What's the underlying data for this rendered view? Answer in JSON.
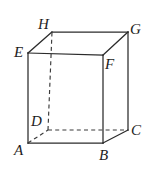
{
  "figure": {
    "kind": "cuboid-oblique-projection",
    "canvas": {
      "width": 150,
      "height": 169
    },
    "colors": {
      "background": "#ffffff",
      "edge_solid": "#2b2b2b",
      "edge_hidden": "#3a3a3a",
      "label": "#1d1d1d",
      "watermark": "#f2f2f2"
    },
    "watermark": {
      "text": "",
      "x": 38,
      "y": 3
    },
    "vertices": [
      {
        "id": "A",
        "x": 28,
        "y": 143,
        "label": "A",
        "label_x": 14,
        "label_y": 143
      },
      {
        "id": "B",
        "x": 103,
        "y": 143,
        "label": "B",
        "label_x": 99,
        "label_y": 148
      },
      {
        "id": "C",
        "x": 128,
        "y": 130,
        "label": "C",
        "label_x": 131,
        "label_y": 123
      },
      {
        "id": "D",
        "x": 48,
        "y": 130,
        "label": "D",
        "label_x": 31,
        "label_y": 114
      },
      {
        "id": "E",
        "x": 28,
        "y": 53,
        "label": "E",
        "label_x": 14,
        "label_y": 45
      },
      {
        "id": "F",
        "x": 103,
        "y": 55,
        "label": "F",
        "label_x": 105,
        "label_y": 57
      },
      {
        "id": "G",
        "x": 128,
        "y": 32,
        "label": "G",
        "label_x": 130,
        "label_y": 22
      },
      {
        "id": "H",
        "x": 52,
        "y": 32,
        "label": "H",
        "label_x": 38,
        "label_y": 17
      }
    ],
    "edges": [
      {
        "id": "EA",
        "from": "E",
        "to": "A",
        "style": "solid",
        "name": "edge-e-a"
      },
      {
        "id": "AB",
        "from": "A",
        "to": "B",
        "style": "solid",
        "name": "edge-a-b"
      },
      {
        "id": "BF",
        "from": "B",
        "to": "F",
        "style": "solid",
        "name": "edge-b-f"
      },
      {
        "id": "EF",
        "from": "E",
        "to": "F",
        "style": "solid",
        "name": "edge-e-f"
      },
      {
        "id": "EH",
        "from": "E",
        "to": "H",
        "style": "solid",
        "name": "edge-e-h"
      },
      {
        "id": "HG",
        "from": "H",
        "to": "G",
        "style": "solid",
        "name": "edge-h-g"
      },
      {
        "id": "GF",
        "from": "G",
        "to": "F",
        "style": "solid",
        "name": "edge-g-f"
      },
      {
        "id": "GC",
        "from": "G",
        "to": "C",
        "style": "solid",
        "name": "edge-g-c"
      },
      {
        "id": "BC",
        "from": "B",
        "to": "C",
        "style": "solid",
        "name": "edge-b-c"
      },
      {
        "id": "AD",
        "from": "A",
        "to": "D",
        "style": "hidden",
        "name": "edge-a-d"
      },
      {
        "id": "DC",
        "from": "D",
        "to": "C",
        "style": "hidden",
        "name": "edge-d-c"
      },
      {
        "id": "DH",
        "from": "D",
        "to": "H",
        "style": "hidden",
        "name": "edge-d-h"
      }
    ]
  }
}
